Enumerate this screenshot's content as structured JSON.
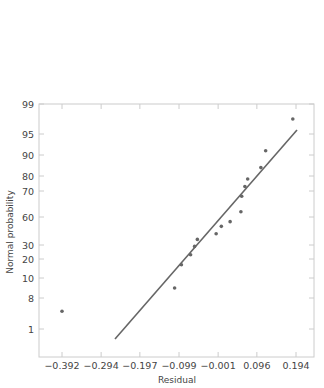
{
  "chart_data": {
    "type": "scatter",
    "title": "",
    "xlabel": "Residual",
    "ylabel": "Normal probability",
    "x_ticks": [
      -0.392,
      -0.294,
      -0.197,
      -0.099,
      -0.001,
      0.096,
      0.194
    ],
    "x_tick_labels": [
      "−0.392",
      "−0.294",
      "−0.197",
      "−0.099",
      "−0.001",
      "0.096",
      "0.194"
    ],
    "y_tick_labels": [
      "99",
      "95",
      "90",
      "80",
      "70",
      "60",
      "30",
      "20",
      "10",
      "8",
      "1"
    ],
    "xlim": [
      -0.45,
      0.24
    ],
    "grid": false,
    "legend": null,
    "points": [
      {
        "x": -0.392,
        "y": 5
      },
      {
        "x": -0.11,
        "y": 9
      },
      {
        "x": -0.093,
        "y": 17
      },
      {
        "x": -0.07,
        "y": 23
      },
      {
        "x": -0.06,
        "y": 29
      },
      {
        "x": -0.053,
        "y": 36
      },
      {
        "x": -0.006,
        "y": 42
      },
      {
        "x": 0.007,
        "y": 50
      },
      {
        "x": 0.029,
        "y": 55
      },
      {
        "x": 0.056,
        "y": 62
      },
      {
        "x": 0.058,
        "y": 68
      },
      {
        "x": 0.066,
        "y": 73
      },
      {
        "x": 0.073,
        "y": 78
      },
      {
        "x": 0.106,
        "y": 84
      },
      {
        "x": 0.118,
        "y": 91
      },
      {
        "x": 0.186,
        "y": 97
      }
    ],
    "fit_line": {
      "x_start": -0.26,
      "x_end": 0.194,
      "description": "reference line"
    }
  },
  "colors": {
    "frame": "#cccccc",
    "points": "#666666",
    "line": "#666666",
    "text": "#444444"
  }
}
